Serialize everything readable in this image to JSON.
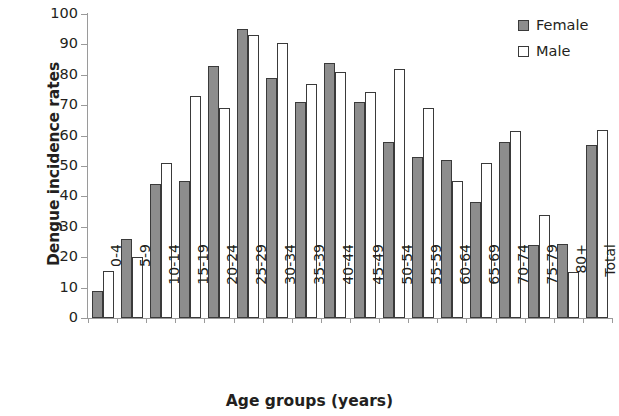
{
  "chart_data": {
    "type": "bar",
    "title": "",
    "xlabel": "Age groups (years)",
    "ylabel": "Dengue incidence rates",
    "ylim": [
      0,
      100
    ],
    "ytick_step": 10,
    "yticks": [
      "0",
      "10",
      "20",
      "30",
      "40",
      "50",
      "60",
      "70",
      "80",
      "90",
      "100"
    ],
    "grid": false,
    "legend_position": "top-right",
    "categories": [
      "0-4",
      "5-9",
      "10-14",
      "15-19",
      "20-24",
      "25-29",
      "30-34",
      "35-39",
      "40-44",
      "45-49",
      "50-54",
      "55-59",
      "60-64",
      "65-69",
      "70-74",
      "75-79",
      "80+",
      "Total"
    ],
    "series": [
      {
        "name": "Female",
        "color": "#8d8d8d",
        "values": [
          9,
          26,
          44,
          45,
          83,
          95,
          79,
          71,
          84,
          71,
          58,
          53,
          52,
          38,
          58,
          24,
          24.5,
          57
        ]
      },
      {
        "name": "Male",
        "color": "#ffffff",
        "values": [
          15.5,
          20,
          51,
          73,
          69,
          93,
          90.5,
          77,
          81,
          74.5,
          82,
          69,
          45,
          51,
          61.5,
          34,
          15,
          62
        ]
      }
    ]
  },
  "legend": {
    "items": [
      {
        "label": "Female",
        "swatch": "filled-gray"
      },
      {
        "label": "Male",
        "swatch": "outline-white"
      }
    ]
  }
}
